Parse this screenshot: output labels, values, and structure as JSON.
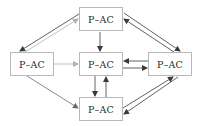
{
  "diagram": {
    "type": "directed-graph",
    "nodes": [
      {
        "id": "top",
        "label": "P–AC"
      },
      {
        "id": "left",
        "label": "P–AC"
      },
      {
        "id": "center",
        "label": "P–AC"
      },
      {
        "id": "right",
        "label": "P–AC"
      },
      {
        "id": "bottom",
        "label": "P–AC"
      }
    ],
    "edges": [
      {
        "from": "top",
        "to": "left",
        "style": "dark"
      },
      {
        "from": "left",
        "to": "top",
        "style": "light"
      },
      {
        "from": "top",
        "to": "center",
        "style": "dark"
      },
      {
        "from": "top",
        "to": "right",
        "style": "dark"
      },
      {
        "from": "right",
        "to": "top",
        "style": "dark"
      },
      {
        "from": "left",
        "to": "center",
        "style": "light"
      },
      {
        "from": "left",
        "to": "bottom",
        "style": "medium"
      },
      {
        "from": "right",
        "to": "center",
        "style": "dark"
      },
      {
        "from": "center",
        "to": "right",
        "style": "dark"
      },
      {
        "from": "center",
        "to": "bottom",
        "style": "dark"
      },
      {
        "from": "bottom",
        "to": "center",
        "style": "dark"
      },
      {
        "from": "bottom",
        "to": "right",
        "style": "dark"
      },
      {
        "from": "right",
        "to": "bottom",
        "style": "dark"
      }
    ],
    "colors": {
      "dark": "#3a3a3a",
      "medium": "#6a6a6a",
      "light": "#b0b0b0",
      "border": "#b8b8b8"
    }
  }
}
